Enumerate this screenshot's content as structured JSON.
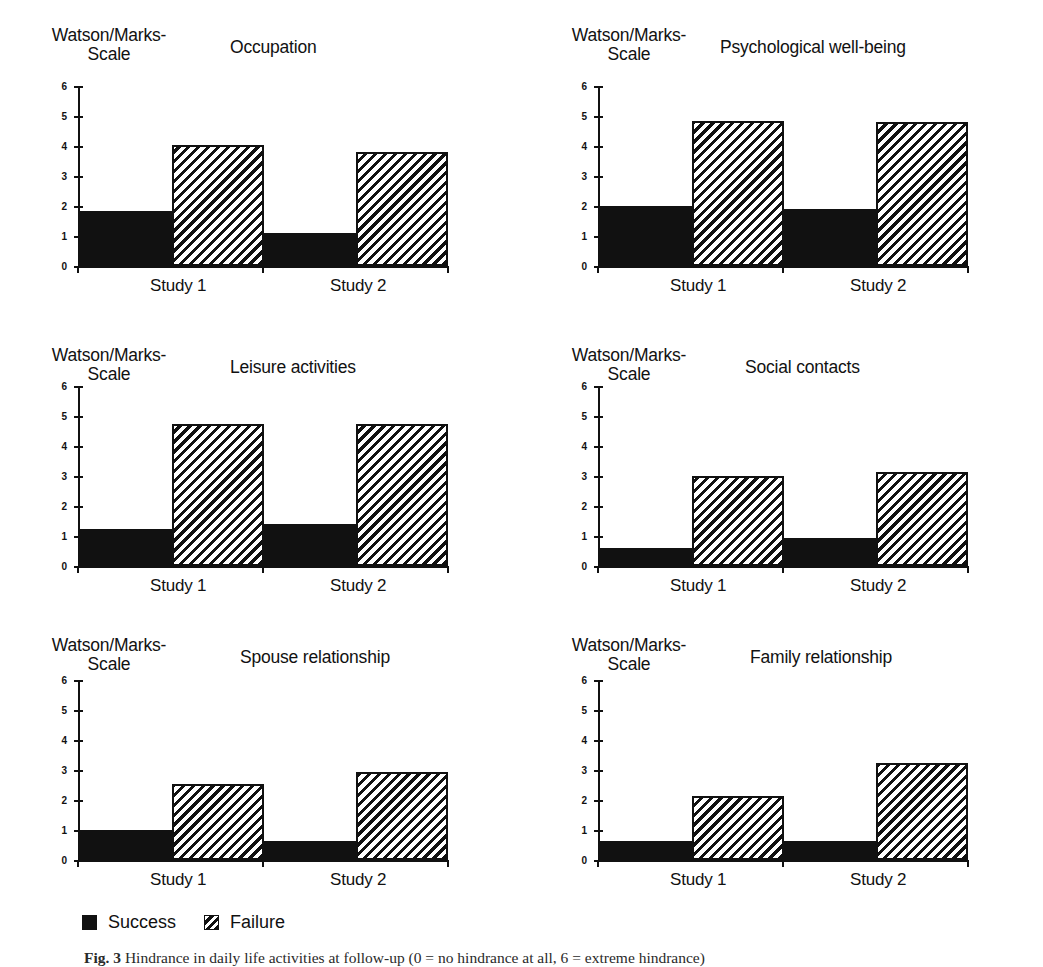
{
  "figure": {
    "caption_prefix": "Fig. 3",
    "caption_text": "Hindrance in daily life activities at follow-up (0 = no hindrance at all, 6 = extreme hindrance)"
  },
  "legend": {
    "position": "bottom-left",
    "items": [
      {
        "label": "Success",
        "swatch": "solid-black-square-icon",
        "color": "#111111"
      },
      {
        "label": "Failure",
        "swatch": "hatched-square-icon",
        "color": "#111111"
      }
    ]
  },
  "common": {
    "y_axis_label": "Watson/Marks-\nScale",
    "y_axis_label_line1": "Watson/Marks-",
    "y_axis_label_line2": "Scale",
    "y_ticks": [
      "0",
      "1",
      "2",
      "3",
      "4",
      "5",
      "6"
    ],
    "x_groups": [
      "Study 1",
      "Study 2"
    ]
  },
  "chart_data": [
    {
      "type": "bar",
      "title": "Occupation",
      "xlabel": "",
      "ylabel": "Watson/Marks-Scale",
      "ylim": [
        0,
        6
      ],
      "grid": false,
      "categories": [
        "Study 1",
        "Study 2"
      ],
      "series": [
        {
          "name": "Success",
          "values": [
            1.85,
            1.1
          ]
        },
        {
          "name": "Failure",
          "values": [
            4.05,
            3.8
          ]
        }
      ]
    },
    {
      "type": "bar",
      "title": "Psychological well-being",
      "xlabel": "",
      "ylabel": "Watson/Marks-Scale",
      "ylim": [
        0,
        6
      ],
      "grid": false,
      "categories": [
        "Study 1",
        "Study 2"
      ],
      "series": [
        {
          "name": "Success",
          "values": [
            2.0,
            1.9
          ]
        },
        {
          "name": "Failure",
          "values": [
            4.85,
            4.8
          ]
        }
      ]
    },
    {
      "type": "bar",
      "title": "Leisure activities",
      "xlabel": "",
      "ylabel": "Watson/Marks-Scale",
      "ylim": [
        0,
        6
      ],
      "grid": false,
      "categories": [
        "Study 1",
        "Study 2"
      ],
      "series": [
        {
          "name": "Success",
          "values": [
            1.25,
            1.4
          ]
        },
        {
          "name": "Failure",
          "values": [
            4.75,
            4.75
          ]
        }
      ]
    },
    {
      "type": "bar",
      "title": "Social contacts",
      "xlabel": "",
      "ylabel": "Watson/Marks-Scale",
      "ylim": [
        0,
        6
      ],
      "grid": false,
      "categories": [
        "Study 1",
        "Study 2"
      ],
      "series": [
        {
          "name": "Success",
          "values": [
            0.6,
            0.92
          ]
        },
        {
          "name": "Failure",
          "values": [
            3.0,
            3.15
          ]
        }
      ]
    },
    {
      "type": "bar",
      "title": "Spouse relationship",
      "xlabel": "",
      "ylabel": "Watson/Marks-Scale",
      "ylim": [
        0,
        6
      ],
      "grid": false,
      "categories": [
        "Study 1",
        "Study 2"
      ],
      "series": [
        {
          "name": "Success",
          "values": [
            1.0,
            0.65
          ]
        },
        {
          "name": "Failure",
          "values": [
            2.55,
            2.95
          ]
        }
      ]
    },
    {
      "type": "bar",
      "title": "Family relationship",
      "xlabel": "",
      "ylabel": "Watson/Marks-Scale",
      "ylim": [
        0,
        6
      ],
      "grid": false,
      "categories": [
        "Study 1",
        "Study 2"
      ],
      "series": [
        {
          "name": "Success",
          "values": [
            0.65,
            0.65
          ]
        },
        {
          "name": "Failure",
          "values": [
            2.15,
            3.25
          ]
        }
      ]
    }
  ],
  "panels": [
    {
      "title_left": 230,
      "plot_top": 88,
      "xlabel_top": 276,
      "xlabel1_left": 150,
      "xlabel2_left": 330
    },
    {
      "title_left": 200,
      "plot_top": 88,
      "xlabel_top": 276,
      "xlabel1_left": 150,
      "xlabel2_left": 330
    },
    {
      "title_left": 230,
      "plot_top": 68,
      "xlabel_top": 256,
      "xlabel1_left": 150,
      "xlabel2_left": 330
    },
    {
      "title_left": 225,
      "plot_top": 68,
      "xlabel_top": 256,
      "xlabel1_left": 150,
      "xlabel2_left": 330
    },
    {
      "title_left": 240,
      "plot_top": 72,
      "xlabel_top": 260,
      "xlabel1_left": 150,
      "xlabel2_left": 330
    },
    {
      "title_left": 230,
      "plot_top": 72,
      "xlabel_top": 260,
      "xlabel1_left": 150,
      "xlabel2_left": 330
    }
  ]
}
